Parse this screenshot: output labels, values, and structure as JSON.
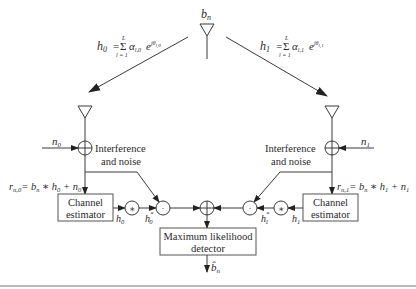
{
  "diagram": {
    "transmitter": {
      "symbol": "b",
      "symbol_sub": "n"
    },
    "channel_left": {
      "lhs": "h",
      "lhs_sub": "0",
      "eq": "=",
      "sum_top": "L",
      "sum_bottom": "l = 1",
      "sigma": "Σ",
      "alpha": "α",
      "alpha_sub": "l,0",
      "exp_base": "e",
      "exp_sup": "jθ",
      "exp_sup_sub": "l,0"
    },
    "channel_right": {
      "lhs": "h",
      "lhs_sub": "1",
      "eq": "=",
      "sum_top": "L",
      "sum_bottom": "l = 1",
      "sigma": "Σ",
      "alpha": "α",
      "alpha_sub": "l,1",
      "exp_base": "e",
      "exp_sup": "jθ",
      "exp_sup_sub": "l,1"
    },
    "noise_left": {
      "symbol": "n",
      "sub": "0"
    },
    "noise_right": {
      "symbol": "n",
      "sub": "1"
    },
    "interference_left": {
      "line1": "Interference",
      "line2": "and noise"
    },
    "interference_right": {
      "line1": "Interference",
      "line2": "and noise"
    },
    "received_left": {
      "r": "r",
      "r_sub": "n,0",
      "rhs": "= b",
      "rhs_sub": "n",
      "mid": " ∗ h",
      "mid_sub": "0",
      "tail": " + n",
      "tail_sub": "0"
    },
    "received_right": {
      "r": "r",
      "r_sub": "n,1",
      "rhs": "= b",
      "rhs_sub": "n",
      "mid": " ∗ h",
      "mid_sub": "1",
      "tail": " + n",
      "tail_sub": "1"
    },
    "estimator_left": {
      "line1": "Channel",
      "line2": "estimator",
      "out": "h",
      "out_sub": "0"
    },
    "estimator_right": {
      "line1": "Channel",
      "line2": "estimator",
      "out": "h",
      "out_sub": "1"
    },
    "conj_left": {
      "symbol": "∗",
      "out": "h",
      "out_sub": "0",
      "out_sup": "*"
    },
    "conj_right": {
      "symbol": "∗",
      "out": "h",
      "out_sub": "1",
      "out_sup": "*"
    },
    "mult_symbol": "·",
    "detector": {
      "line1": "Maximum likelihood",
      "line2": "detector"
    },
    "output": {
      "symbol": "b̂",
      "sub": "n"
    }
  },
  "colors": {
    "stroke": "#3a3a3a",
    "text": "#2a2a2a",
    "bottom_rule": "#777777"
  }
}
